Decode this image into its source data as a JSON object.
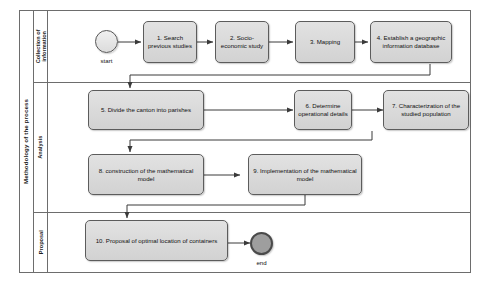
{
  "diagram": {
    "pool_label": "Methodology of the process",
    "lanes": [
      {
        "id": "collection",
        "label": "Collection of\ninformation"
      },
      {
        "id": "analysis",
        "label": "Analysis"
      },
      {
        "id": "proposal",
        "label": "Proposal"
      }
    ],
    "events": [
      {
        "id": "start",
        "type": "start-event",
        "label": "start"
      },
      {
        "id": "end",
        "type": "end-event",
        "label": "end"
      }
    ],
    "tasks": [
      {
        "id": "task-1",
        "lane": "collection",
        "label": "1. Search previous studies"
      },
      {
        "id": "task-2",
        "lane": "collection",
        "label": "2. Socio-economic study"
      },
      {
        "id": "task-3",
        "lane": "collection",
        "label": "3. Mapping"
      },
      {
        "id": "task-4",
        "lane": "collection",
        "label": "4. Establish a geographic information database"
      },
      {
        "id": "task-5",
        "lane": "analysis",
        "label": "5. Divide the canton into parishes"
      },
      {
        "id": "task-6",
        "lane": "analysis",
        "label": "6. Determine operational details"
      },
      {
        "id": "task-7",
        "lane": "analysis",
        "label": "7. Characterization of the studied population"
      },
      {
        "id": "task-8",
        "lane": "analysis",
        "label": "8. construction of the mathematical model"
      },
      {
        "id": "task-9",
        "lane": "analysis",
        "label": "9. Implementation of the mathematical model"
      },
      {
        "id": "task-10",
        "lane": "proposal",
        "label": "10. Proposal of optimal location of containers"
      }
    ],
    "flows": [
      {
        "from": "start",
        "to": "task-1"
      },
      {
        "from": "task-1",
        "to": "task-2"
      },
      {
        "from": "task-2",
        "to": "task-3"
      },
      {
        "from": "task-3",
        "to": "task-4"
      },
      {
        "from": "task-4",
        "to": "task-5"
      },
      {
        "from": "task-5",
        "to": "task-6"
      },
      {
        "from": "task-6",
        "to": "task-7"
      },
      {
        "from": "task-7",
        "to": "task-8"
      },
      {
        "from": "task-8",
        "to": "task-9"
      },
      {
        "from": "task-9",
        "to": "task-10"
      },
      {
        "from": "task-10",
        "to": "end"
      }
    ],
    "colors": {
      "task_fill": "#d9d9d9",
      "task_border": "#5c5c5c",
      "lane_border": "#6d6d6d",
      "end_fill": "#9e9e9e",
      "connector": "#3a3a3a"
    }
  }
}
